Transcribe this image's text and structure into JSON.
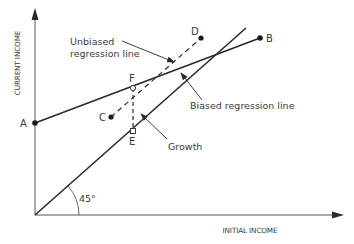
{
  "axes": {
    "y_label": "CURRENT INCOME",
    "x_label": "INITIAL INCOME"
  },
  "angle_label": "45°",
  "points": {
    "A": "A",
    "B": "B",
    "C": "C",
    "D": "D",
    "E": "E",
    "F": "F"
  },
  "annotations": {
    "unbiased_line1": "Unbiased",
    "unbiased_line2": "regression line",
    "biased": "Biased regression line",
    "growth": "Growth"
  },
  "colors": {
    "line": "#2a2a2a",
    "axis": "#555555",
    "text": "#3a3a3a"
  }
}
